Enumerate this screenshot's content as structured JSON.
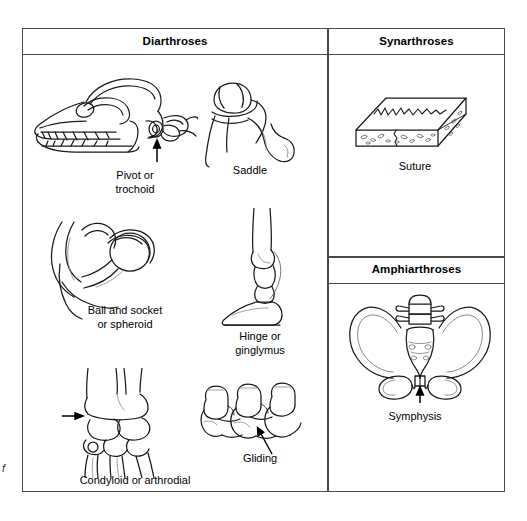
{
  "figure": {
    "type": "anatomical-classification-table",
    "background_color": "#ffffff",
    "line_color": "#1a1a1a",
    "border_color": "#4a4a4a"
  },
  "sections": [
    {
      "id": "diarthroses",
      "title": "Diarthroses",
      "column": "left",
      "items": [
        {
          "id": "pivot",
          "label": "Pivot or\ntrochoid",
          "illustration": "canine-skull-with-atlas-axis-vertebrae",
          "has_arrow_pointer": true
        },
        {
          "id": "saddle",
          "label": "Saddle",
          "illustration": "saddle-joint-bones",
          "has_arrow_pointer": false
        },
        {
          "id": "ball-and-socket",
          "label": "Ball and socket\nor spheroid",
          "illustration": "hip-joint-femoral-head-acetabulum",
          "has_arrow_pointer": false
        },
        {
          "id": "hinge",
          "label": "Hinge or\nginglymus",
          "illustration": "equine-fetlock-and-hoof",
          "has_arrow_pointer": false
        },
        {
          "id": "condyloid",
          "label": "Condyloid or arthrodial",
          "illustration": "carpal-joint-radius-ulna-carpals",
          "has_arrow_pointer": true
        },
        {
          "id": "gliding",
          "label": "Gliding",
          "illustration": "articulated-vertebrae-facet-joints",
          "has_arrow_pointer": true
        }
      ]
    },
    {
      "id": "synarthroses",
      "title": "Synarthroses",
      "column": "right",
      "items": [
        {
          "id": "suture",
          "label": "Suture",
          "illustration": "flat-bone-slab-with-interlocking-suture-line",
          "has_arrow_pointer": false
        }
      ]
    },
    {
      "id": "amphiarthroses",
      "title": "Amphiarthroses",
      "column": "right",
      "items": [
        {
          "id": "symphysis",
          "label": "Symphysis",
          "illustration": "pelvis-with-pubic-symphysis",
          "has_arrow_pointer": true
        }
      ]
    }
  ],
  "margin_text": "f"
}
